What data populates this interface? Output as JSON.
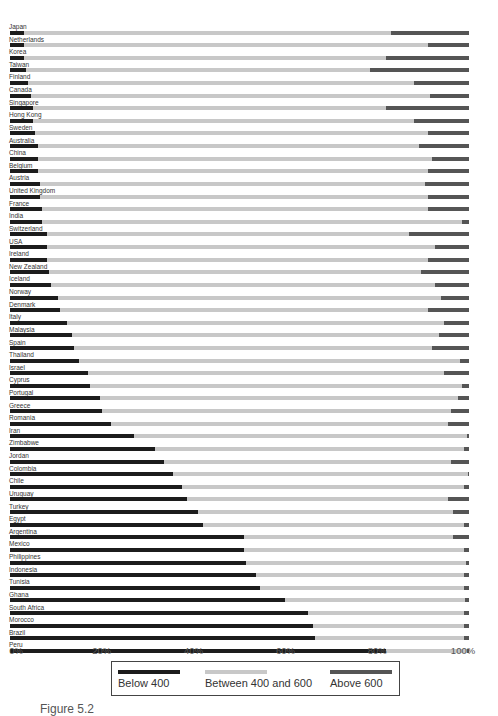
{
  "chart_data": {
    "type": "bar",
    "orientation": "horizontal",
    "stacked": true,
    "normalized": true,
    "title": "",
    "xlabel": "",
    "ylabel": "",
    "xlim": [
      0,
      100
    ],
    "x_ticks": [
      "0%",
      "20%",
      "40%",
      "60%",
      "80%",
      "100%"
    ],
    "grid": false,
    "legend_position": "bottom",
    "categories": [
      "Japan",
      "Netherlands",
      "Korea",
      "Taiwan",
      "Finland",
      "Canada",
      "Singapore",
      "Hong Kong",
      "Sweden",
      "Australia",
      "China",
      "Belgium",
      "Austria",
      "United Kingdom",
      "France",
      "India",
      "Switzerland",
      "USA",
      "Ireland",
      "New Zealand",
      "Iceland",
      "Norway",
      "Denmark",
      "Italy",
      "Malaysia",
      "Spain",
      "Thailand",
      "Israel",
      "Cyprus",
      "Portugal",
      "Greece",
      "Romania",
      "Iran",
      "Zimbabwe",
      "Jordan",
      "Colombia",
      "Chile",
      "Uruguay",
      "Turkey",
      "Egypt",
      "Argentina",
      "Mexico",
      "Philippines",
      "Indonesia",
      "Tunisia",
      "Ghana",
      "South Africa",
      "Morocco",
      "Brazil",
      "Peru"
    ],
    "series": [
      {
        "name": "Below 400",
        "color": "#1c1c1c",
        "values": [
          3,
          3,
          3,
          3.5,
          4,
          4.5,
          5,
          5,
          5.5,
          6,
          6,
          6,
          6.5,
          6.5,
          7,
          7,
          8,
          8,
          8,
          8.5,
          9,
          10.5,
          11,
          12.5,
          13.5,
          14,
          15,
          17,
          17.5,
          19.5,
          20,
          22,
          27,
          31.5,
          33.5,
          35.5,
          37.5,
          38.5,
          41,
          42,
          51,
          51,
          51.5,
          53.5,
          54.5,
          60,
          65,
          66,
          66.5,
          82
        ]
      },
      {
        "name": "Between 400 and 600",
        "color": "#c8c8c8",
        "values": [
          80,
          88,
          79,
          75,
          84,
          87,
          77,
          83,
          85.5,
          83,
          86,
          85,
          84,
          84.5,
          84,
          91.5,
          79,
          84.5,
          83,
          81,
          83.5,
          83.5,
          80,
          82,
          80,
          78,
          83,
          77.5,
          81,
          78,
          76,
          73.5,
          72.5,
          67.5,
          62.5,
          64.2,
          61.5,
          57,
          55.5,
          57,
          45.5,
          48,
          47.9,
          45.5,
          44.5,
          39.2,
          34,
          33,
          32.5,
          17.6
        ]
      },
      {
        "name": "Above 600",
        "color": "#555555",
        "values": [
          17,
          9,
          18,
          21.5,
          12,
          8.5,
          18,
          12,
          9,
          11,
          8,
          9,
          9.5,
          9,
          9,
          1.5,
          13,
          7.5,
          9,
          10.5,
          7.5,
          6,
          9,
          5.5,
          6.5,
          8,
          2,
          5.5,
          1.5,
          2.5,
          4,
          4.5,
          0.5,
          1,
          4,
          0.3,
          1,
          4.5,
          3.5,
          1,
          3.5,
          1,
          0.6,
          1,
          1,
          0.8,
          1,
          1,
          1,
          0.4
        ]
      }
    ]
  },
  "legend": {
    "items": [
      {
        "label": "Below 400",
        "color": "#1c1c1c"
      },
      {
        "label": "Between 400 and 600",
        "color": "#c8c8c8"
      },
      {
        "label": "Above 600",
        "color": "#555555"
      }
    ]
  },
  "caption": "Figure 5.2"
}
